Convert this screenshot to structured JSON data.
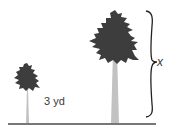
{
  "diagram": {
    "small_tree": {
      "height_label": "3 yd"
    },
    "large_tree": {
      "height_label": "x"
    },
    "colors": {
      "crown": "#3d3d3d",
      "trunk": "#c2c2c2",
      "ground": "#4a4a4a",
      "brace": "#222222"
    }
  }
}
